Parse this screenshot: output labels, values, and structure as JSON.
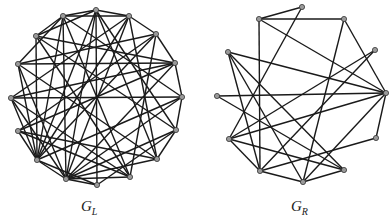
{
  "graphs": [
    {
      "id": "GL",
      "label_main": "G",
      "label_sub": "L",
      "label_pos": [
        81,
        198
      ],
      "nodes": [
        [
          96,
          10
        ],
        [
          63,
          16
        ],
        [
          129,
          16
        ],
        [
          36,
          36
        ],
        [
          156,
          34
        ],
        [
          18,
          64
        ],
        [
          175,
          63
        ],
        [
          11,
          98
        ],
        [
          182,
          97
        ],
        [
          18,
          131
        ],
        [
          176,
          130
        ],
        [
          37,
          160
        ],
        [
          157,
          159
        ],
        [
          66,
          179
        ],
        [
          130,
          177
        ],
        [
          97,
          185
        ]
      ],
      "edges": [
        [
          0,
          1
        ],
        [
          0,
          2
        ],
        [
          0,
          15
        ],
        [
          0,
          3
        ],
        [
          0,
          11
        ],
        [
          0,
          13
        ],
        [
          0,
          10
        ],
        [
          0,
          12
        ],
        [
          1,
          2
        ],
        [
          1,
          3
        ],
        [
          1,
          5
        ],
        [
          1,
          11
        ],
        [
          1,
          13
        ],
        [
          1,
          14
        ],
        [
          1,
          8
        ],
        [
          2,
          4
        ],
        [
          2,
          7
        ],
        [
          2,
          13
        ],
        [
          2,
          11
        ],
        [
          2,
          12
        ],
        [
          3,
          6
        ],
        [
          3,
          10
        ],
        [
          3,
          14
        ],
        [
          3,
          11
        ],
        [
          4,
          6
        ],
        [
          4,
          5
        ],
        [
          4,
          11
        ],
        [
          4,
          14
        ],
        [
          4,
          9
        ],
        [
          5,
          6
        ],
        [
          5,
          11
        ],
        [
          5,
          13
        ],
        [
          5,
          12
        ],
        [
          6,
          8
        ],
        [
          6,
          13
        ],
        [
          6,
          7
        ],
        [
          6,
          9
        ],
        [
          7,
          8
        ],
        [
          7,
          14
        ],
        [
          7,
          11
        ],
        [
          7,
          13
        ],
        [
          8,
          10
        ],
        [
          8,
          11
        ],
        [
          8,
          13
        ],
        [
          9,
          11
        ],
        [
          9,
          12
        ],
        [
          9,
          14
        ],
        [
          10,
          12
        ],
        [
          10,
          13
        ],
        [
          10,
          15
        ],
        [
          11,
          13
        ],
        [
          11,
          15
        ],
        [
          12,
          13
        ],
        [
          13,
          14
        ],
        [
          13,
          15
        ]
      ]
    },
    {
      "id": "GR",
      "label_main": "G",
      "label_sub": "R",
      "label_pos": [
        291,
        198
      ],
      "nodes": [
        [
          302,
          7
        ],
        [
          259,
          19
        ],
        [
          344,
          19
        ],
        [
          228,
          52
        ],
        [
          375,
          50
        ],
        [
          217,
          96
        ],
        [
          386,
          93
        ],
        [
          229,
          139
        ],
        [
          376,
          138
        ],
        [
          260,
          171
        ],
        [
          344,
          170
        ],
        [
          303,
          182
        ]
      ],
      "edges": [
        [
          0,
          1
        ],
        [
          1,
          2
        ],
        [
          1,
          9
        ],
        [
          1,
          6
        ],
        [
          0,
          7
        ],
        [
          2,
          6
        ],
        [
          2,
          11
        ],
        [
          3,
          6
        ],
        [
          3,
          10
        ],
        [
          3,
          11
        ],
        [
          5,
          6
        ],
        [
          5,
          10
        ],
        [
          4,
          7
        ],
        [
          4,
          9
        ],
        [
          6,
          7
        ],
        [
          6,
          8
        ],
        [
          7,
          10
        ],
        [
          9,
          11
        ],
        [
          8,
          9
        ],
        [
          10,
          11
        ],
        [
          6,
          11
        ],
        [
          7,
          9
        ],
        [
          3,
          9
        ]
      ]
    }
  ]
}
